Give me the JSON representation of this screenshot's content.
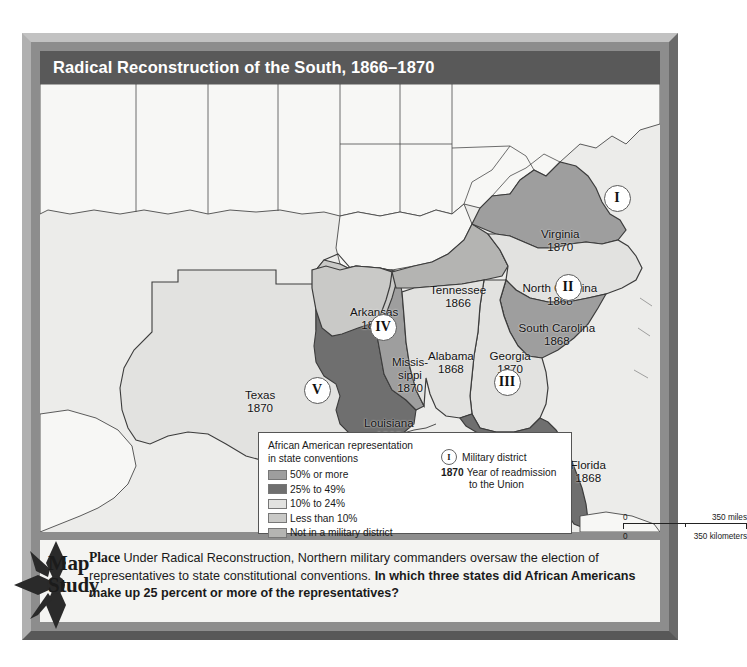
{
  "title": "Radical Reconstruction of the South, 1866–1870",
  "colors": {
    "pct50_or_more": "#9e9e9e",
    "pct25_to_49": "#6f6f6f",
    "pct10_to_24": "#e2e2e0",
    "less_than_10": "#c9c9c7",
    "not_in_district": "#b4b4b2",
    "non_south_land": "#f7f7f5",
    "ocean": "#ececea",
    "frame": "#8d8d8d",
    "title_bar": "#595959"
  },
  "legend": {
    "title_line1": "African American representation",
    "title_line2": "in state conventions",
    "items": [
      {
        "label": "50% or more",
        "color": "#9e9e9e"
      },
      {
        "label": "25% to 49%",
        "color": "#6f6f6f"
      },
      {
        "label": "10% to 24%",
        "color": "#e2e2e0"
      },
      {
        "label": "Less than 10%",
        "color": "#c9c9c7"
      },
      {
        "label": "Not in a military district",
        "color": "#b4b4b2"
      }
    ],
    "military_district_symbol": "I",
    "military_district_label": "Military district",
    "year_example": "1870",
    "year_label_line1": "Year of readmission",
    "year_label_line2": "to the Union",
    "scale": {
      "miles_zero": "0",
      "miles_max": "350 miles",
      "km_zero": "0",
      "km_max": "350 kilometers"
    }
  },
  "compass": {
    "letter": "N"
  },
  "states": [
    {
      "name": "Virginia",
      "year": "1870",
      "label_x": 520,
      "label_y": 144,
      "shade": "pct50_or_more"
    },
    {
      "name": "North Carolina",
      "year": "1868",
      "label_x": 520,
      "label_y": 198,
      "shade": "pct10_to_24"
    },
    {
      "name": "South Carolina",
      "year": "1868",
      "label_x": 517,
      "label_y": 238,
      "shade": "pct50_or_more"
    },
    {
      "name": "Tennessee",
      "year": "1866",
      "label_x": 418,
      "label_y": 200,
      "shade": "not_in_district"
    },
    {
      "name": "Georgia",
      "year": "1870",
      "label_x": 470,
      "label_y": 266,
      "shade": "pct10_to_24"
    },
    {
      "name": "Alabama",
      "year": "1868",
      "label_x": 411,
      "label_y": 266,
      "shade": "pct10_to_24"
    },
    {
      "name": "Arkansas",
      "year": "1868",
      "label_x": 334,
      "label_y": 222,
      "shade": "less_than_10"
    },
    {
      "name": "Missis-\nsippi",
      "year": "1870",
      "label_x": 370,
      "label_y": 272,
      "shade": "pct50_or_more"
    },
    {
      "name": "Louisiana",
      "year": "1868",
      "label_x": 349,
      "label_y": 333,
      "shade": "pct25_to_49"
    },
    {
      "name": "Texas",
      "year": "1870",
      "label_x": 220,
      "label_y": 305,
      "shade": "pct10_to_24"
    },
    {
      "name": "Florida",
      "year": "1868",
      "label_x": 548,
      "label_y": 375,
      "shade": "pct25_to_49"
    }
  ],
  "districts": [
    {
      "numeral": "I",
      "x": 577,
      "y": 114
    },
    {
      "numeral": "II",
      "x": 528,
      "y": 203
    },
    {
      "numeral": "III",
      "x": 467,
      "y": 298
    },
    {
      "numeral": "IV",
      "x": 343,
      "y": 243
    },
    {
      "numeral": "V",
      "x": 277,
      "y": 306
    }
  ],
  "caption": {
    "place": "Place",
    "text_a": " Under Radical Reconstruction, Northern military commanders oversaw the election of representatives to state constitutional conventions. ",
    "question": "In which three states did African Americans make up 25 percent or more of the representatives?"
  },
  "badge": {
    "line1": "Map",
    "line2": "Study"
  }
}
